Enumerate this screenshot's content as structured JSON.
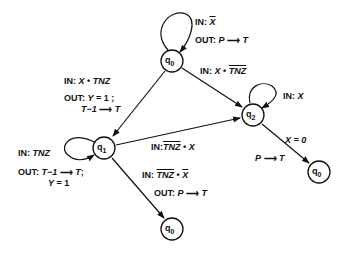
{
  "diagram": {
    "type": "state-machine",
    "nodes": [
      {
        "id": "q0_top",
        "label": "q",
        "sub": "0",
        "x": 172,
        "y": 61
      },
      {
        "id": "q1",
        "label": "q",
        "sub": "1",
        "x": 104,
        "y": 148
      },
      {
        "id": "q2",
        "label": "q",
        "sub": "2",
        "x": 253,
        "y": 115
      },
      {
        "id": "q0_right",
        "label": "q",
        "sub": "0",
        "x": 319,
        "y": 172
      },
      {
        "id": "q0_bottom",
        "label": "q",
        "sub": "0",
        "x": 172,
        "y": 229
      }
    ],
    "edges": [
      {
        "from": "q0_top",
        "to": "q0_top",
        "in": "X̄",
        "out": "P → T"
      },
      {
        "from": "q0_top",
        "to": "q2",
        "in": "X • T̄N̄Z̄"
      },
      {
        "from": "q0_top",
        "to": "q1",
        "in": "X • TNZ",
        "out": "Y = 1; T−1 → T"
      },
      {
        "from": "q1",
        "to": "q1",
        "in": "TNZ",
        "out": "T−1 → T; Y = 1"
      },
      {
        "from": "q1",
        "to": "q2",
        "in": "T̄N̄Z̄ • X"
      },
      {
        "from": "q1",
        "to": "q0_bottom",
        "in": "T̄N̄Z̄ • X̄",
        "out": "P → T"
      },
      {
        "from": "q2",
        "to": "q2",
        "in": "X"
      },
      {
        "from": "q2",
        "to": "q0_right",
        "in": "X = 0",
        "out": "P → T"
      }
    ]
  },
  "labels": {
    "in": "IN:",
    "out": "OUT:",
    "x": "X",
    "tnz": "TNZ",
    "dot": "•",
    "p": "P",
    "t": "T",
    "y": "Y",
    "eq1": "= 1",
    "eq1semi": "= 1 ;",
    "t_minus_1": "T−1",
    "semi": ";",
    "x_eq_0": "X = 0",
    "q": "q",
    "s0": "0",
    "s1": "1",
    "s2": "2"
  }
}
